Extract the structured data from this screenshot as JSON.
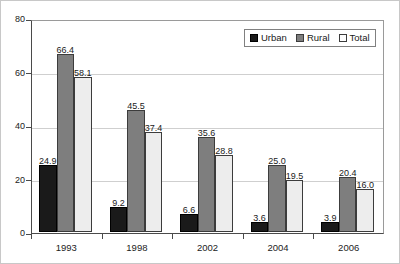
{
  "chart_data": {
    "type": "bar",
    "title": "",
    "subtitle": "",
    "xlabel": "",
    "ylabel": "",
    "categories": [
      "1993",
      "1998",
      "2002",
      "2004",
      "2006"
    ],
    "series": [
      {
        "name": "Urban",
        "color": "#1a1a1a",
        "values": [
          24.9,
          9.2,
          6.6,
          3.6,
          3.9
        ]
      },
      {
        "name": "Rural",
        "color": "#7e7e7e",
        "values": [
          66.4,
          45.5,
          35.6,
          25.0,
          20.4
        ]
      },
      {
        "name": "Total",
        "color": "#ededed",
        "values": [
          58.1,
          37.4,
          28.8,
          19.5,
          16.0
        ]
      }
    ],
    "value_labels": [
      [
        "24.9",
        "66.4",
        "58.1"
      ],
      [
        "9.2",
        "45.5",
        "37.4"
      ],
      [
        "6.6",
        "35.6",
        "28.8"
      ],
      [
        "3.6",
        "25.0",
        "19.5"
      ],
      [
        "3.9",
        "20.4",
        "16.0"
      ]
    ],
    "ylim": [
      0,
      80
    ],
    "yticks": [
      0,
      20,
      40,
      60,
      80
    ],
    "ytick_labels": [
      "0",
      "20",
      "40",
      "60",
      "80"
    ],
    "grid": "horizontal",
    "legend_position": "top-right",
    "legend": [
      "Urban",
      "Rural",
      "Total"
    ]
  }
}
